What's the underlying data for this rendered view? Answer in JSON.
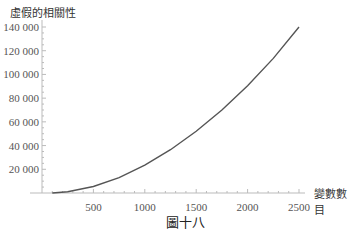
{
  "chart_data": {
    "type": "line",
    "title": "",
    "ylabel": "虛假的相關性",
    "xlabel": "變數數目",
    "caption": "圖十八",
    "xlim": [
      0,
      2500
    ],
    "ylim": [
      0,
      140000
    ],
    "x_ticks": [
      500,
      1000,
      1500,
      2000,
      2500
    ],
    "y_ticks": [
      20000,
      40000,
      60000,
      80000,
      100000,
      120000,
      140000
    ],
    "x_tick_labels": [
      "500",
      "1000",
      "1500",
      "2000",
      "2500"
    ],
    "y_tick_labels": [
      "20 000",
      "40 000",
      "60 000",
      "80 000",
      "100 000",
      "120 000",
      "140 000"
    ],
    "grid": false,
    "legend": null,
    "series": [
      {
        "name": "虛假的相關性",
        "x": [
          100,
          250,
          500,
          750,
          1000,
          1250,
          1500,
          1750,
          2000,
          2250,
          2500
        ],
        "values": [
          0,
          1000,
          5500,
          13000,
          23500,
          36500,
          52000,
          70000,
          90500,
          113500,
          140000
        ]
      }
    ]
  }
}
